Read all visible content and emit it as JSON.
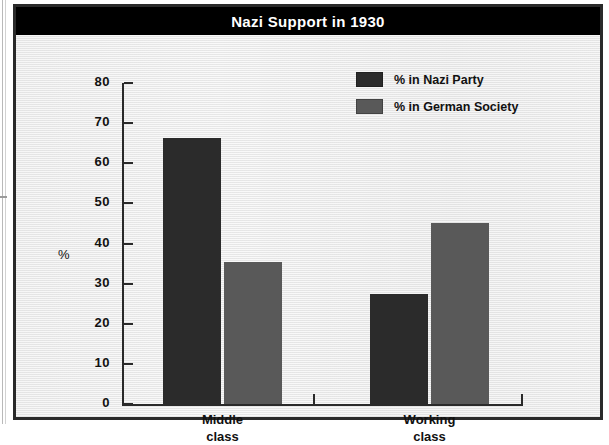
{
  "figure": {
    "title": "Nazi Support in 1930",
    "frame_color": "#2a2a2a",
    "background_color": "#ededed",
    "title_bar_color": "#000000",
    "title_text_color": "#ffffff"
  },
  "chart_data": {
    "type": "bar",
    "title": "Nazi Support in 1930",
    "xlabel": "",
    "ylabel": "%",
    "categories": [
      "Middle class",
      "Working class"
    ],
    "category_lines": [
      [
        "Middle",
        "class"
      ],
      [
        "Working",
        "class"
      ]
    ],
    "series": [
      {
        "name": "% in Nazi Party",
        "color": "#2b2b2b",
        "values": [
          66.3,
          27.3
        ]
      },
      {
        "name": "% in German Society",
        "color": "#595959",
        "values": [
          35.4,
          45.1
        ]
      }
    ],
    "ylim": [
      0,
      80
    ],
    "yticks": [
      80,
      70,
      60,
      50,
      40,
      30,
      20,
      10,
      0
    ],
    "ytick_labels": [
      "80",
      "70",
      "60",
      "50",
      "40",
      "30",
      "20",
      "10",
      "0"
    ],
    "grid": false,
    "legend_position": "upper-right-inside"
  },
  "legend": {
    "items": [
      {
        "label": "% in Nazi Party",
        "color": "#2b2b2b"
      },
      {
        "label": "% in German Society",
        "color": "#595959"
      }
    ]
  }
}
